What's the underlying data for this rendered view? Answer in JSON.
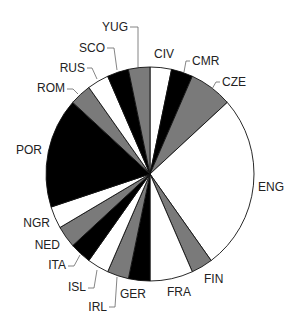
{
  "chart_data": {
    "type": "pie",
    "title": "",
    "start_angle_deg": 0,
    "direction": "clockwise",
    "total": 30,
    "slices": [
      {
        "label": "CIV",
        "value": 1,
        "color": "#ffffff"
      },
      {
        "label": "CMR",
        "value": 1,
        "color": "#000000"
      },
      {
        "label": "CZE",
        "value": 2,
        "color": "#7a7a7a"
      },
      {
        "label": "ENG",
        "value": 8,
        "color": "#ffffff"
      },
      {
        "label": "FIN",
        "value": 1,
        "color": "#7a7a7a"
      },
      {
        "label": "FRA",
        "value": 2,
        "color": "#ffffff"
      },
      {
        "label": "GER",
        "value": 1,
        "color": "#000000"
      },
      {
        "label": "IRL",
        "value": 1,
        "color": "#7a7a7a"
      },
      {
        "label": "ISL",
        "value": 1,
        "color": "#ffffff"
      },
      {
        "label": "ITA",
        "value": 1,
        "color": "#000000"
      },
      {
        "label": "NED",
        "value": 1,
        "color": "#7a7a7a"
      },
      {
        "label": "NGR",
        "value": 1,
        "color": "#ffffff"
      },
      {
        "label": "POR",
        "value": 5,
        "color": "#000000"
      },
      {
        "label": "ROM",
        "value": 1,
        "color": "#7a7a7a"
      },
      {
        "label": "RUS",
        "value": 1,
        "color": "#ffffff"
      },
      {
        "label": "SCO",
        "value": 1,
        "color": "#000000"
      },
      {
        "label": "YUG",
        "value": 1,
        "color": "#7a7a7a"
      }
    ],
    "legend": "none (direct labels)"
  },
  "layout": {
    "cx": 150,
    "cy": 174,
    "rx": 104,
    "ry": 107,
    "labels": [
      {
        "label": "CIV",
        "x": 154,
        "y": 58,
        "anchor": "start",
        "leader": []
      },
      {
        "label": "CMR",
        "x": 192,
        "y": 65,
        "anchor": "start",
        "leader": [
          [
            190,
            61
          ],
          [
            186,
            61
          ],
          [
            184,
            72
          ]
        ]
      },
      {
        "label": "CZE",
        "x": 222,
        "y": 86,
        "anchor": "start",
        "leader": [
          [
            220,
            82
          ],
          [
            216,
            82
          ],
          [
            212,
            89
          ]
        ]
      },
      {
        "label": "ENG",
        "x": 258,
        "y": 191,
        "anchor": "start",
        "leader": []
      },
      {
        "label": "FIN",
        "x": 204,
        "y": 283,
        "anchor": "start",
        "leader": []
      },
      {
        "label": "FRA",
        "x": 167,
        "y": 296,
        "anchor": "start",
        "leader": []
      },
      {
        "label": "GER",
        "x": 120,
        "y": 298,
        "anchor": "start",
        "leader": []
      },
      {
        "label": "IRL",
        "x": 107,
        "y": 311,
        "anchor": "end",
        "leader": [
          [
            109,
            307
          ],
          [
            115,
            307
          ],
          [
            117,
            277
          ]
        ]
      },
      {
        "label": "ISL",
        "x": 86,
        "y": 291,
        "anchor": "end",
        "leader": [
          [
            88,
            288
          ],
          [
            94,
            288
          ],
          [
            97,
            270
          ]
        ]
      },
      {
        "label": "ITA",
        "x": 66,
        "y": 269,
        "anchor": "end",
        "leader": [
          [
            68,
            266
          ],
          [
            74,
            266
          ],
          [
            80,
            255
          ]
        ]
      },
      {
        "label": "NED",
        "x": 60,
        "y": 249,
        "anchor": "end",
        "leader": []
      },
      {
        "label": "NGR",
        "x": 50,
        "y": 227,
        "anchor": "end",
        "leader": []
      },
      {
        "label": "POR",
        "x": 42,
        "y": 154,
        "anchor": "end",
        "leader": []
      },
      {
        "label": "ROM",
        "x": 65,
        "y": 92,
        "anchor": "end",
        "leader": [
          [
            67,
            89
          ],
          [
            73,
            89
          ],
          [
            78,
            94
          ]
        ]
      },
      {
        "label": "RUS",
        "x": 85,
        "y": 72,
        "anchor": "end",
        "leader": [
          [
            87,
            68
          ],
          [
            92,
            68
          ],
          [
            97,
            79
          ]
        ]
      },
      {
        "label": "SCO",
        "x": 105,
        "y": 52,
        "anchor": "end",
        "leader": [
          [
            107,
            48
          ],
          [
            114,
            48
          ],
          [
            117,
            70
          ]
        ]
      },
      {
        "label": "YUG",
        "x": 128,
        "y": 31,
        "anchor": "end",
        "leader": [
          [
            130,
            27
          ],
          [
            138,
            27
          ],
          [
            138,
            67
          ]
        ]
      }
    ]
  }
}
